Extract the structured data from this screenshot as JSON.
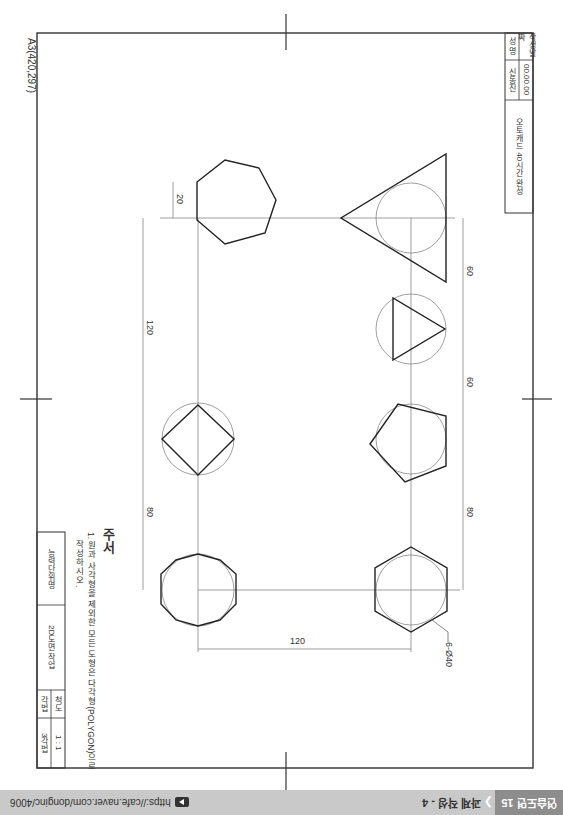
{
  "sheet": {
    "paper_label": "A3(420,297)",
    "title_block_top": {
      "date_label": "작성날짜",
      "date_value": "00.00.00",
      "name_label": "성 명",
      "name_value": "신동진",
      "title": "오토캐드 40시간 완성"
    },
    "title_block_bottom": {
      "org": "능력단위명",
      "work": "2D도면 작업",
      "scale_label": "척도",
      "scale_value": "1 : 1",
      "method_label": "각법",
      "method_value": "3각법"
    },
    "notes": {
      "heading": "주서",
      "line1": "1. 원과 사각형을 제외한 모든 도형은 다각형(POLYGON)으로",
      "line2": "작성하시오."
    },
    "dimensions": {
      "heptagon_offset": "20",
      "left_span": "120",
      "left_lower": "80",
      "right_upper": "60",
      "right_middle": "60",
      "right_lower": "80",
      "bottom_span": "120",
      "leader_callout": "6-Ø40"
    }
  },
  "footer": {
    "brand": "연습도면 15",
    "title": "과제 작성 - 4",
    "link": "https://cafe.naver.com/donginc/4006",
    "colors": {
      "bar": "#c9c9c9",
      "brand_bg": "#8d8d8d"
    }
  }
}
